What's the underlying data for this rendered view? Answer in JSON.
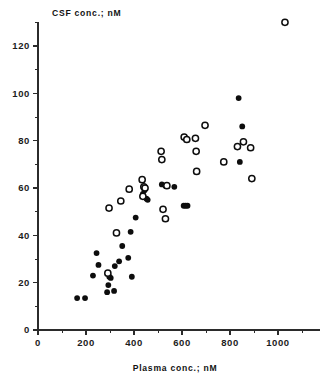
{
  "figure": {
    "background_color": "#ffffff",
    "ink_color": "#0d0d0d",
    "y_axis_title": "CSF conc.; nM",
    "x_axis_title": "Plasma conc.; nM"
  },
  "chart_data": {
    "type": "scatter",
    "title": "",
    "xlabel": "Plasma conc.; nM",
    "ylabel": "CSF conc.; nM",
    "xlim": [
      0,
      1150
    ],
    "ylim": [
      0,
      132
    ],
    "grid": false,
    "legend": "none",
    "x_ticks_major": [
      0,
      200,
      400,
      600,
      800,
      1000
    ],
    "x_tick_labels": [
      "0",
      "200",
      "400",
      "600",
      "800",
      "1000"
    ],
    "x_ticks_minor": [
      100,
      300,
      500,
      700,
      900,
      1100
    ],
    "y_ticks_major": [
      0,
      20,
      40,
      60,
      80,
      100,
      120
    ],
    "y_tick_labels": [
      "0",
      "20",
      "40",
      "60",
      "80",
      "100",
      "120"
    ],
    "y_ticks_minor": [
      10,
      30,
      50,
      70,
      90,
      110,
      130
    ],
    "series": [
      {
        "name": "filled-circles",
        "marker": "filled-circle",
        "color": "#0d0d0d",
        "points": [
          [
            163,
            13.5
          ],
          [
            196,
            13.5
          ],
          [
            229,
            23.0
          ],
          [
            244,
            32.5
          ],
          [
            252,
            27.5
          ],
          [
            288,
            16.0
          ],
          [
            293,
            19.0
          ],
          [
            297,
            22.5
          ],
          [
            303,
            22.0
          ],
          [
            317,
            16.5
          ],
          [
            320,
            27.0
          ],
          [
            338,
            29.0
          ],
          [
            351,
            35.5
          ],
          [
            376,
            30.5
          ],
          [
            386,
            41.5
          ],
          [
            391,
            22.5
          ],
          [
            407,
            47.5
          ],
          [
            437,
            57.5
          ],
          [
            444,
            59.0
          ],
          [
            452,
            55.5
          ],
          [
            457,
            55.0
          ],
          [
            516,
            61.5
          ],
          [
            531,
            61.0
          ],
          [
            568,
            60.5
          ],
          [
            607,
            52.5
          ],
          [
            615,
            52.5
          ],
          [
            623,
            52.5
          ],
          [
            612,
            81.0
          ],
          [
            836,
            98.0
          ],
          [
            851,
            86.0
          ],
          [
            841,
            71.0
          ]
        ]
      },
      {
        "name": "open-circles",
        "marker": "open-circle",
        "color": "#0d0d0d",
        "points": [
          [
            291,
            24.0
          ],
          [
            327,
            41.0
          ],
          [
            296,
            51.5
          ],
          [
            345,
            54.5
          ],
          [
            380,
            59.5
          ],
          [
            434,
            63.5
          ],
          [
            441,
            60.5
          ],
          [
            446,
            60.0
          ],
          [
            437,
            56.5
          ],
          [
            513,
            75.5
          ],
          [
            516,
            72.0
          ],
          [
            521,
            51.0
          ],
          [
            531,
            47.0
          ],
          [
            537,
            61.0
          ],
          [
            609,
            81.5
          ],
          [
            620,
            80.5
          ],
          [
            656,
            81.0
          ],
          [
            659,
            75.5
          ],
          [
            661,
            67.0
          ],
          [
            696,
            86.5
          ],
          [
            774,
            71.0
          ],
          [
            831,
            77.5
          ],
          [
            856,
            79.5
          ],
          [
            886,
            77.0
          ],
          [
            891,
            64.0
          ],
          [
            1029,
            130.0
          ]
        ]
      }
    ]
  }
}
